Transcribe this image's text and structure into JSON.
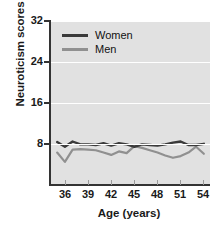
{
  "chart_data": {
    "type": "line",
    "title": "",
    "xlabel": "Age (years)",
    "ylabel": "Neuroticism scores",
    "xlim": [
      34.2,
      54.8
    ],
    "ylim": [
      4.0,
      32.0
    ],
    "xticks": [
      36,
      39,
      42,
      45,
      48,
      51,
      54
    ],
    "yticks": [
      8,
      16,
      24,
      32
    ],
    "grid": "horizontal-white",
    "legend_position": "top-left-inside",
    "x": [
      35,
      36,
      37,
      38,
      39,
      40,
      41,
      42,
      43,
      44,
      45,
      46,
      47,
      48,
      49,
      50,
      51,
      52,
      53,
      54
    ],
    "series": [
      {
        "name": "Women",
        "color": "#3a3a3a",
        "values": [
          11.2,
          10.4,
          11.3,
          10.8,
          10.8,
          10.7,
          11.0,
          10.6,
          11.0,
          10.8,
          10.4,
          10.8,
          10.7,
          10.6,
          10.8,
          11.1,
          11.3,
          10.7,
          10.7,
          10.9
        ]
      },
      {
        "name": "Men",
        "color": "#909090",
        "values": [
          9.4,
          7.8,
          9.9,
          10.0,
          9.9,
          9.8,
          9.4,
          9.0,
          9.6,
          9.3,
          10.5,
          10.2,
          9.8,
          9.4,
          8.9,
          8.5,
          8.8,
          9.4,
          10.4,
          9.2
        ]
      }
    ]
  },
  "axes": {
    "ylabel": "Neuroticism scores",
    "xlabel": "Age (years)",
    "ytick_labels": [
      "32",
      "24",
      "16",
      "8"
    ],
    "xtick_labels": [
      "36",
      "39",
      "42",
      "45",
      "48",
      "51",
      "54"
    ]
  },
  "legend": {
    "items": [
      {
        "label": "Women",
        "color": "#3a3a3a"
      },
      {
        "label": "Men",
        "color": "#909090"
      }
    ]
  },
  "colors": {
    "plot_background": "#e1e1e1",
    "gridline": "#ffffff",
    "axis": "#333333",
    "women_line": "#3a3a3a",
    "men_line": "#909090",
    "text": "#1a1a1a"
  }
}
